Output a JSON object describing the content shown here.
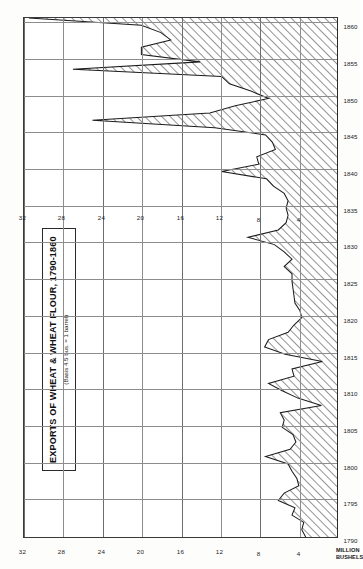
{
  "figure": {
    "title": "EXPORTS OF WHEAT & WHEAT FLOUR, 1790-1860",
    "subtitle": "(Basis 4.5 bus. = 1 barrel)",
    "value_axis_name": "MILLION\nBUSHELS"
  },
  "chart_data": {
    "type": "area",
    "title": "EXPORTS OF WHEAT & WHEAT FLOUR, 1790-1860",
    "subtitle": "(Basis 4.5 bus. = 1 barrel)",
    "xlabel": "",
    "ylabel": "MILLION BUSHELS",
    "orientation": "rotated-90ccw",
    "grid": true,
    "legend": null,
    "xlim": [
      1790,
      1861
    ],
    "ylim": [
      0,
      32
    ],
    "x_ticks": [
      1790,
      1795,
      1800,
      1805,
      1810,
      1815,
      1820,
      1825,
      1830,
      1835,
      1840,
      1845,
      1850,
      1855,
      1860
    ],
    "y_ticks": [
      4,
      8,
      12,
      16,
      20,
      24,
      28,
      32
    ],
    "x_tick_labels": [
      "1790",
      "1795",
      "1800",
      "1805",
      "1810",
      "1815",
      "1820",
      "1825",
      "1830",
      "1835",
      "1840",
      "1845",
      "1850",
      "1855",
      "1860"
    ],
    "y_tick_labels": [
      "4",
      "8",
      "12",
      "16",
      "20",
      "24",
      "28",
      "32"
    ],
    "fill": "diagonal-hatch",
    "series": [
      {
        "name": "Exports of wheat & wheat flour",
        "x": [
          1790,
          1791,
          1792,
          1793,
          1794,
          1795,
          1796,
          1797,
          1798,
          1799,
          1800,
          1801,
          1802,
          1803,
          1804,
          1805,
          1806,
          1807,
          1808,
          1809,
          1810,
          1811,
          1812,
          1813,
          1814,
          1815,
          1816,
          1817,
          1818,
          1819,
          1820,
          1821,
          1822,
          1823,
          1824,
          1825,
          1826,
          1827,
          1828,
          1829,
          1830,
          1831,
          1832,
          1833,
          1834,
          1835,
          1836,
          1837,
          1838,
          1839,
          1840,
          1841,
          1842,
          1843,
          1844,
          1845,
          1846,
          1847,
          1848,
          1849,
          1850,
          1851,
          1852,
          1853,
          1854,
          1855,
          1856,
          1857,
          1858,
          1859,
          1860,
          1861
        ],
        "values": [
          3.2,
          3.6,
          3.4,
          4.6,
          4.3,
          6.0,
          5.4,
          3.9,
          4.1,
          4.6,
          5.0,
          7.3,
          4.8,
          4.2,
          4.5,
          5.6,
          5.4,
          5.8,
          1.6,
          4.0,
          5.6,
          7.0,
          4.4,
          4.6,
          1.5,
          5.3,
          7.4,
          7.0,
          5.0,
          4.4,
          3.6,
          3.8,
          4.3,
          4.4,
          4.5,
          4.6,
          4.6,
          5.4,
          4.6,
          5.4,
          6.4,
          9.1,
          6.0,
          5.2,
          5.0,
          5.2,
          5.0,
          5.4,
          6.5,
          7.2,
          11.8,
          8.0,
          8.2,
          6.3,
          6.6,
          7.3,
          12.5,
          25.0,
          13.0,
          10.4,
          7.0,
          8.8,
          11.0,
          11.8,
          27.0,
          14.0,
          20.0,
          20.0,
          17.0,
          18.0,
          20.0,
          31.5
        ],
        "annotations": [
          {
            "x": 1796,
            "value": 6.0,
            "kind": "peak"
          },
          {
            "x": 1801,
            "value": 7.3,
            "kind": "peak"
          },
          {
            "x": 1808,
            "value": 1.6,
            "kind": "embargo-trough"
          },
          {
            "x": 1814,
            "value": 1.5,
            "kind": "war-trough"
          },
          {
            "x": 1817,
            "value": 7.4,
            "kind": "peak"
          },
          {
            "x": 1831,
            "value": 9.1,
            "kind": "peak"
          },
          {
            "x": 1840,
            "value": 11.8,
            "kind": "peak"
          },
          {
            "x": 1847,
            "value": 25.0,
            "kind": "famine-peak"
          },
          {
            "x": 1854,
            "value": 27.0,
            "kind": "peak"
          },
          {
            "x": 1861,
            "value": 31.5,
            "kind": "max-peak"
          }
        ]
      }
    ]
  }
}
